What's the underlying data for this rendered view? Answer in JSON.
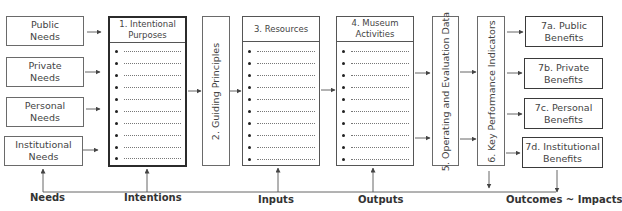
{
  "title_fragment": "p          g",
  "needs": [
    {
      "label": "Public\nNeeds",
      "l1": "Public",
      "l2": "Needs"
    },
    {
      "l1": "Private",
      "l2": "Needs"
    },
    {
      "l1": "Personal",
      "l2": "Needs"
    },
    {
      "l1": "Institutional",
      "l2": "Needs"
    }
  ],
  "columns": {
    "intentional": {
      "l1": "1. Intentional",
      "l2": "Purposes",
      "bullets": 10
    },
    "guiding": {
      "label": "2. Guiding Principles"
    },
    "resources": {
      "label": "3. Resources",
      "bullets": 10
    },
    "activities": {
      "label": "4. Museum Activities",
      "bullets": 10
    },
    "operating": {
      "label": "5. Operating and Evaluation Data"
    },
    "kpi": {
      "label": "6. Key Performance Indicators"
    }
  },
  "benefits": [
    {
      "l1": "7a. Public",
      "l2": "Benefits"
    },
    {
      "l1": "7b. Private",
      "l2": "Benefits"
    },
    {
      "l1": "7c. Personal",
      "l2": "Benefits"
    },
    {
      "l1": "7d. Institutional",
      "l2": "Benefits"
    }
  ],
  "stages": {
    "needs": "Needs",
    "intentions": "Intentions",
    "inputs": "Inputs",
    "outputs": "Outputs",
    "outcomes": "Outcomes ~ Impacts"
  },
  "colors": {
    "line": "#555555",
    "thick_border": "#2b2b2b",
    "text": "#444444"
  }
}
